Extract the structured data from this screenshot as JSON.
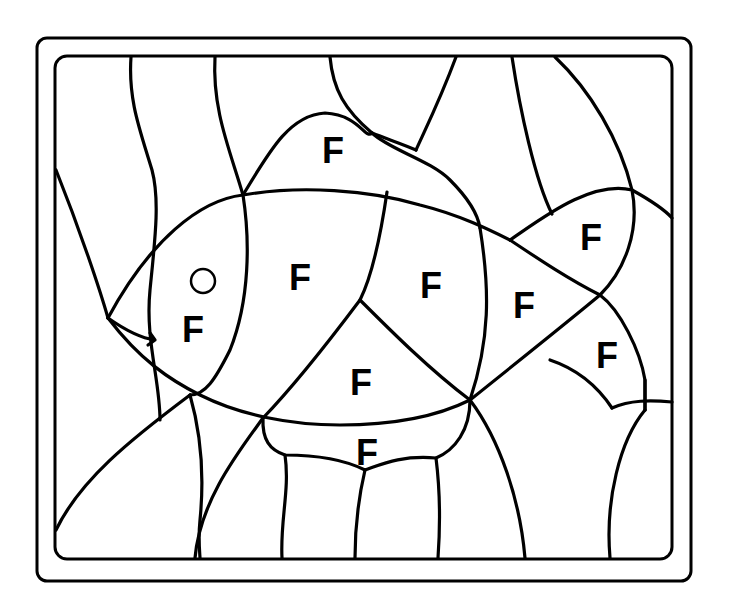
{
  "page": {
    "colors": {
      "line": "#000000",
      "background": "#ffffff"
    }
  },
  "letters": [
    {
      "id": "dorsal-fin",
      "text": "F",
      "x": 333,
      "y": 163
    },
    {
      "id": "head",
      "text": "F",
      "x": 193,
      "y": 342
    },
    {
      "id": "body-front",
      "text": "F",
      "x": 300,
      "y": 290
    },
    {
      "id": "body-middle",
      "text": "F",
      "x": 431,
      "y": 298
    },
    {
      "id": "body-rear",
      "text": "F",
      "x": 524,
      "y": 318
    },
    {
      "id": "tail-upper",
      "text": "F",
      "x": 591,
      "y": 250
    },
    {
      "id": "tail-lower",
      "text": "F",
      "x": 607,
      "y": 368
    },
    {
      "id": "belly",
      "text": "F",
      "x": 361,
      "y": 395
    },
    {
      "id": "pelvic-fin",
      "text": "F",
      "x": 367,
      "y": 465
    }
  ],
  "eye": {
    "cx": 203,
    "cy": 281,
    "r": 12
  }
}
